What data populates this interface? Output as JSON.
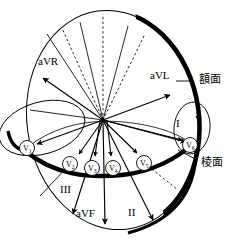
{
  "figure": {
    "background_color": "#ffffff",
    "stroke_color": "#000000",
    "width": 237,
    "height": 241
  },
  "planes": [
    {
      "id": "frontal",
      "label": "額面",
      "label_x": 198,
      "label_y": 76,
      "leader_from_x": 193,
      "leader_from_y": 81,
      "leader_to_x": 176,
      "leader_to_y": 81,
      "description": "frontal plane thick arc on right of ellipse"
    },
    {
      "id": "horizontal",
      "label": "棱面",
      "label_x": 200,
      "label_y": 163,
      "leader_from_x": 197,
      "leader_from_y": 163,
      "leader_to_x": 178,
      "leader_to_y": 152,
      "description": "horizontal/transverse plane thick arc across middle"
    }
  ],
  "origin": {
    "x": 103,
    "y": 120
  },
  "limb_leads": [
    {
      "name": "aVR",
      "label": "aVR",
      "label_x": 44,
      "label_y": 62,
      "tip_x": 43,
      "tip_y": 78,
      "angle_deg": -150
    },
    {
      "name": "aVL",
      "label": "aVL",
      "label_x": 152,
      "label_y": 77,
      "tip_x": 170,
      "tip_y": 95,
      "angle_deg": -30
    },
    {
      "name": "I",
      "label": "I",
      "label_x": 178,
      "label_y": 124,
      "tip_x": 188,
      "tip_y": 142,
      "angle_deg": 0
    },
    {
      "name": "II",
      "label": "II",
      "label_x": 131,
      "label_y": 213,
      "tip_x": 153,
      "tip_y": 220,
      "angle_deg": 60
    },
    {
      "name": "III",
      "label": "III",
      "label_x": 64,
      "label_y": 190,
      "tip_x": 73,
      "tip_y": 214,
      "angle_deg": 120
    },
    {
      "name": "aVF",
      "label": "aVF",
      "label_x": 80,
      "label_y": 214,
      "tip_x": 105,
      "tip_y": 224,
      "angle_deg": 90
    }
  ],
  "precordial_leads": [
    {
      "name": "V1",
      "base": "V",
      "sub": "1",
      "cx": 27,
      "cy": 148,
      "r": 7.5,
      "tip_x": 37,
      "tip_y": 144
    },
    {
      "name": "V2",
      "base": "V",
      "sub": "2",
      "cx": 70,
      "cy": 164,
      "r": 7.5,
      "tip_x": 79,
      "tip_y": 154
    },
    {
      "name": "V3",
      "base": "V",
      "sub": "3",
      "cx": 92,
      "cy": 168,
      "r": 7.5,
      "tip_x": 95,
      "tip_y": 156
    },
    {
      "name": "V4",
      "base": "V",
      "sub": "4",
      "cx": 113,
      "cy": 168,
      "r": 7.5,
      "tip_x": 111,
      "tip_y": 156
    },
    {
      "name": "V5",
      "base": "V",
      "sub": "5",
      "cx": 144,
      "cy": 163,
      "r": 7.5,
      "tip_x": 137,
      "tip_y": 153
    },
    {
      "name": "V6",
      "base": "V",
      "sub": "6",
      "cx": 190,
      "cy": 145,
      "r": 7.5,
      "tip_x": 182,
      "tip_y": 140
    }
  ],
  "dashed_rays": [
    {
      "id": "vertical-up",
      "to_x": 103,
      "to_y": 14
    },
    {
      "id": "upper-left",
      "to_x": 62,
      "to_y": 28
    },
    {
      "id": "upper-right",
      "to_x": 145,
      "to_y": 34
    },
    {
      "id": "lower-right-outer",
      "to_x": 174,
      "to_y": 185
    }
  ],
  "solid_rays": [
    {
      "id": "ray-upper-left-1",
      "to_x": 47,
      "to_y": 34
    },
    {
      "id": "ray-upper-mid",
      "to_x": 80,
      "to_y": 22
    },
    {
      "id": "ray-upper-right-1",
      "to_x": 128,
      "to_y": 26
    },
    {
      "id": "ray-left-horizon",
      "to_x": 32,
      "to_y": 109
    },
    {
      "id": "ray-lower-left",
      "to_x": 25,
      "to_y": 175
    }
  ],
  "shapes": {
    "main_ellipse": {
      "cx": 113,
      "cy": 120,
      "rx": 86,
      "ry": 110,
      "rotation_deg": -8
    },
    "left_lobe": {
      "cx": 42,
      "cy": 128,
      "rx": 44,
      "ry": 26,
      "rotation_deg": -16
    },
    "right_lobe": {
      "cx": 192,
      "cy": 128,
      "rx": 18,
      "ry": 26,
      "rotation_deg": 6
    }
  }
}
